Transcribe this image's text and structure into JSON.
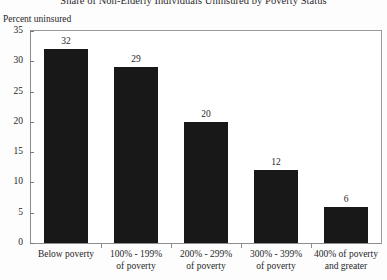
{
  "chart_data": {
    "type": "bar",
    "title": "Share of Non-Elderly Individuals Uninsured by Poverty Status",
    "xlabel": "",
    "ylabel": "Percent uninsured",
    "ylim": [
      0,
      35
    ],
    "yticks": [
      0,
      5,
      10,
      15,
      20,
      25,
      30,
      35
    ],
    "grid": false,
    "legend": false,
    "bar_color": "#181818",
    "categories": [
      "Below poverty",
      "100% - 199% of poverty",
      "200% - 299% of poverty",
      "300% - 399% of poverty",
      "400% of poverty and greater"
    ],
    "category_lines": [
      [
        "Below poverty",
        ""
      ],
      [
        "100% - 199%",
        "of poverty"
      ],
      [
        "200% - 299%",
        "of poverty"
      ],
      [
        "300% - 399%",
        "of poverty"
      ],
      [
        "400% of poverty",
        "and greater"
      ]
    ],
    "values": [
      32,
      29,
      20,
      12,
      6
    ],
    "value_labels": [
      "32",
      "29",
      "20",
      "12",
      "6"
    ]
  },
  "axis": {
    "y_tick_labels": [
      "35",
      "30",
      "25",
      "20",
      "15",
      "10",
      "5",
      "0"
    ]
  }
}
